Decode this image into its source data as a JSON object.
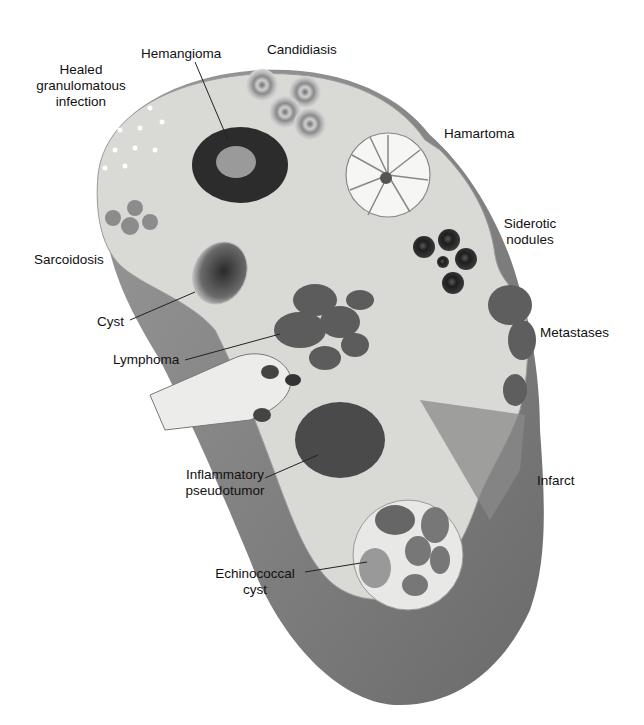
{
  "figure": {
    "colors": {
      "parenchyma": "#d9d9d6",
      "capsule": "#8a8a8a",
      "capsule_dark": "#6e6e6e",
      "lesion_dark": "#3c3c3c",
      "label_text": "#111111",
      "leader_line": "#222222"
    }
  },
  "labels": {
    "hemangioma": "Hemangioma",
    "candidiasis": "Candidiasis",
    "healed_granulomatous_1": "Healed",
    "healed_granulomatous_2": "granulomatous",
    "healed_granulomatous_3": "infection",
    "hamartoma": "Hamartoma",
    "siderotic_1": "Siderotic",
    "siderotic_2": "nodules",
    "sarcoidosis": "Sarcoidosis",
    "cyst": "Cyst",
    "metastases": "Metastases",
    "lymphoma": "Lymphoma",
    "inflammatory_1": "Inflammatory",
    "inflammatory_2": "pseudotumor",
    "infarct": "Infarct",
    "echinococcal_1": "Echinococcal",
    "echinococcal_2": "cyst"
  }
}
